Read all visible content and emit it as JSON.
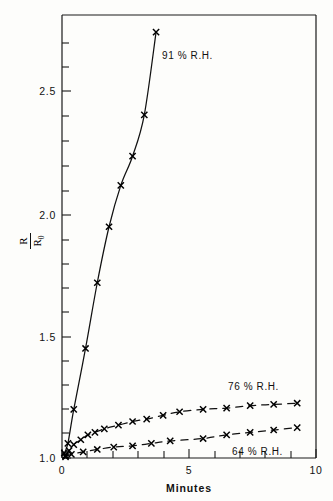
{
  "figure": {
    "background_color": "#fdfdfb",
    "ink_color": "#111111"
  },
  "axis": {
    "y_title_numerator": "R",
    "y_title_denominator": "R",
    "y_title_denominator_sub": "0",
    "x_title": "Minutes",
    "y_tick_labels": [
      "1.0",
      "1.5",
      "2.0",
      "2.5"
    ],
    "y_tick_values": [
      1.0,
      1.5,
      2.0,
      2.5
    ],
    "x_tick_labels": [
      "0",
      "5",
      "10"
    ],
    "x_tick_values": [
      0,
      5,
      10
    ]
  },
  "labels": {
    "series_91": "91 % R.H.",
    "series_76": "76 % R.H.",
    "series_64": "64 % R.H."
  },
  "chart_data": {
    "type": "line",
    "title": "",
    "subtitle": "",
    "xlabel": "Minutes",
    "ylabel": "R/R0",
    "xlim": [
      0,
      10.8
    ],
    "ylim": [
      1.0,
      2.82
    ],
    "grid": false,
    "legend_position": "inline-annotation",
    "marker": "x",
    "x_major_ticks": [
      0,
      5,
      10
    ],
    "x_minor_ticks": [
      1,
      2,
      3,
      4,
      6,
      7,
      8,
      9
    ],
    "y_major_ticks": [
      1.0,
      1.5,
      2.0,
      2.5
    ],
    "y_minor_tick_step": 0.1,
    "series": [
      {
        "name": "91 % R.H.",
        "label": "91 % R.H.",
        "linestyle": "solid",
        "x": [
          0.1,
          0.25,
          0.5,
          1.0,
          1.5,
          2.0,
          2.5,
          3.0,
          3.5,
          4.0
        ],
        "y": [
          1.02,
          1.06,
          1.2,
          1.45,
          1.72,
          1.95,
          2.12,
          2.24,
          2.41,
          2.75
        ]
      },
      {
        "name": "76 % R.H.",
        "label": "76 % R.H.",
        "linestyle": "dashed",
        "x": [
          0.15,
          0.3,
          0.5,
          0.8,
          1.1,
          1.4,
          1.8,
          2.4,
          3.0,
          3.6,
          4.3,
          5.0,
          6.0,
          7.0,
          8.0,
          9.0,
          10.0
        ],
        "y": [
          1.01,
          1.03,
          1.055,
          1.075,
          1.095,
          1.105,
          1.12,
          1.135,
          1.15,
          1.16,
          1.175,
          1.19,
          1.2,
          1.205,
          1.215,
          1.22,
          1.225
        ]
      },
      {
        "name": "64 % R.H.",
        "label": "64 % R.H.",
        "linestyle": "dashed",
        "x": [
          0.15,
          0.4,
          0.9,
          1.5,
          2.2,
          3.0,
          3.8,
          4.6,
          6.0,
          7.0,
          8.0,
          9.0,
          10.0
        ],
        "y": [
          1.005,
          1.015,
          1.025,
          1.035,
          1.045,
          1.05,
          1.06,
          1.07,
          1.08,
          1.095,
          1.105,
          1.115,
          1.125
        ]
      }
    ]
  }
}
